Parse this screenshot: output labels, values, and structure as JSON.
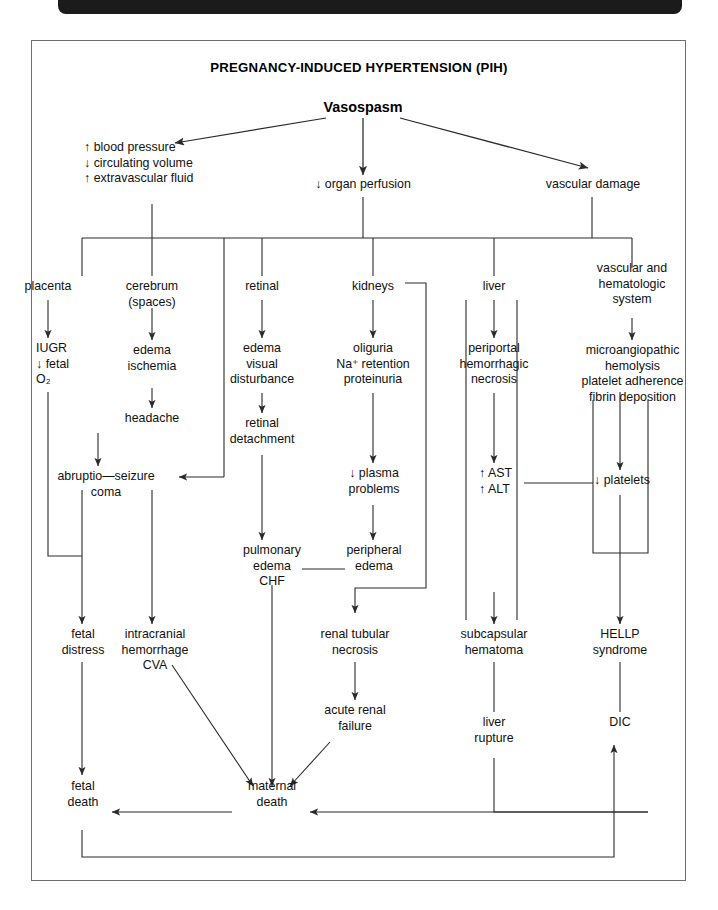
{
  "page": {
    "title": "PREGNANCY-INDUCED HYPERTENSION (PIH)",
    "root": "Vasospasm",
    "border_color": "#6e6e6e",
    "line_color": "#2a2a2a",
    "header_bar_color": "#1b1b1b"
  },
  "tier1": [
    {
      "id": "bp",
      "text": "↑ blood pressure\n↓ circulating volume\n↑ extravascular fluid"
    },
    {
      "id": "perf",
      "text": "↓ organ perfusion"
    },
    {
      "id": "vascdam",
      "text": "vascular damage"
    }
  ],
  "organs": [
    {
      "id": "placenta",
      "text": "placenta"
    },
    {
      "id": "cerebrum",
      "text": "cerebrum\n(spaces)"
    },
    {
      "id": "retinal",
      "text": "retinal"
    },
    {
      "id": "kidneys",
      "text": "kidneys"
    },
    {
      "id": "liver",
      "text": "liver"
    },
    {
      "id": "vashem",
      "text": "vascular and\nhematologic\nsystem"
    }
  ],
  "nodes": {
    "iugr": "IUGR\n↓ fetal\nO₂",
    "edema_isch": "edema\nischemia",
    "headache": "headache",
    "ret_edema": "edema\nvisual\ndisturbance",
    "ret_detach": "retinal\ndetachment",
    "oliguria": "oliguria\nNa⁺ retention\nproteinuria",
    "periportal": "periportal\nhemorrhagic\nnecrosis",
    "microang": "microangiopathic\nhemolysis\nplatelet adherence\nfibrin deposition",
    "abruptio": "abruptio—seizure\ncoma",
    "plasma": "↓ plasma\nproblems",
    "ast_alt": "↑ AST\n↑ ALT",
    "platelets": "↓ platelets",
    "pulm": "pulmonary\nedema\nCHF",
    "periph": "peripheral\nedema",
    "fetal_dist": "fetal\ndistress",
    "intracran": "intracranial\nhemorrhage\nCVA",
    "renal_tub": "renal tubular\nnecrosis",
    "subcaps": "subcapsular\nhematoma",
    "hellp": "HELLP\nsyndrome",
    "acute_renal": "acute renal\nfailure",
    "liver_rup": "liver\nrupture",
    "dic": "DIC",
    "fetal_death": "fetal\ndeath",
    "mat_death": "maternal\ndeath"
  }
}
